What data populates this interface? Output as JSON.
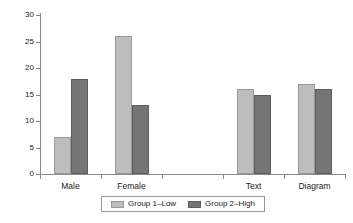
{
  "chart_data": {
    "type": "bar",
    "title": "",
    "xlabel": "",
    "ylabel": "",
    "ylim": [
      0,
      30
    ],
    "yticks": [
      0,
      5,
      10,
      15,
      20,
      25,
      30
    ],
    "grid": false,
    "legend_position": "bottom",
    "categories": [
      "Male",
      "Female",
      "",
      "Text",
      "Diagram"
    ],
    "series": [
      {
        "name": "Group 1–Low",
        "color": "#bdbdbd",
        "values": [
          7,
          26,
          null,
          16,
          17
        ]
      },
      {
        "name": "Group 2–High",
        "color": "#757575",
        "values": [
          18,
          13,
          null,
          15,
          16
        ]
      }
    ]
  },
  "legend": {
    "items": [
      {
        "label": "Group 1–Low",
        "swatch": "low"
      },
      {
        "label": "Group 2–High",
        "swatch": "high"
      }
    ]
  },
  "colors": {
    "series_low": "#bdbdbd",
    "series_high": "#757575",
    "axis": "#8a8a8a",
    "text": "#1a1a1a",
    "background": "#ffffff"
  }
}
